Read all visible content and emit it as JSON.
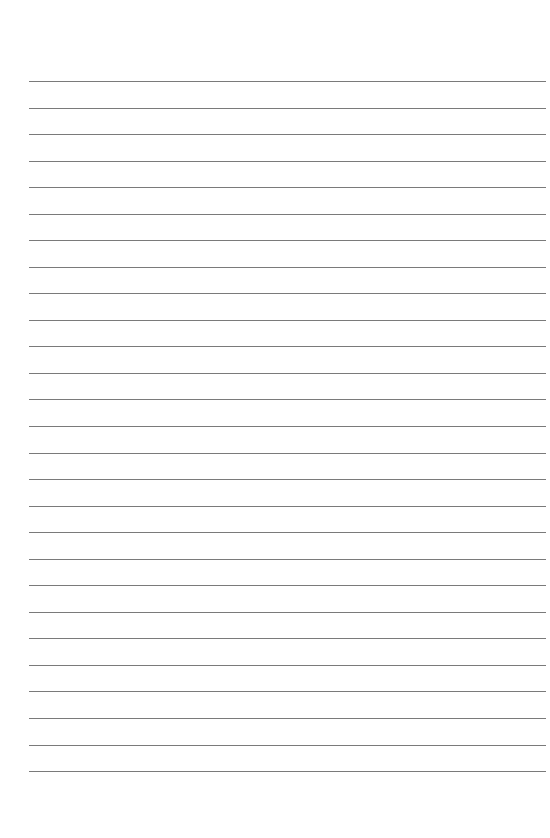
{
  "page": {
    "type": "lined-paper",
    "line_count": 27,
    "first_line_y": 81,
    "line_spacing": 26.54,
    "line_left": 29,
    "line_right": 546,
    "line_color": "#7a7a7a",
    "background": "#ffffff"
  }
}
